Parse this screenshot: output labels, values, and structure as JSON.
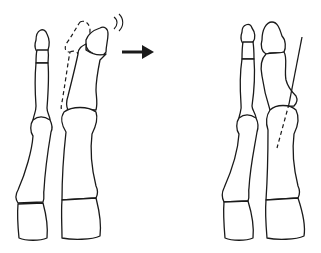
{
  "figure": {
    "panels": [
      {
        "id": "before",
        "description": "Deviated toe with dashed outline of original position and motion marks"
      },
      {
        "id": "after",
        "description": "Corrected toe alignment with axis line"
      }
    ],
    "arrow": {
      "direction": "right",
      "meaning": "transition"
    },
    "colors": {
      "stroke": "#1a1a1a",
      "background": "#ffffff"
    }
  }
}
